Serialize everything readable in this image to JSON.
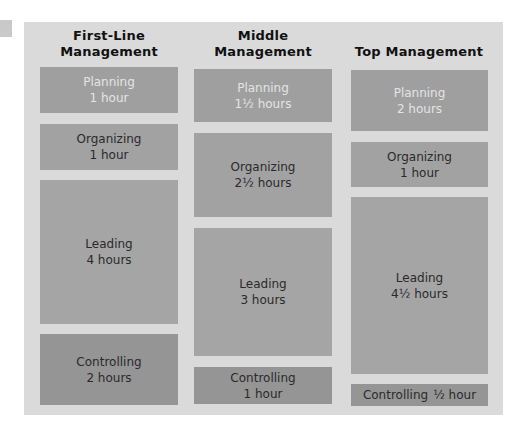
{
  "columns": [
    {
      "header_line1": "First-Line",
      "header_line2": "Management",
      "activities": [
        {
          "name": "Planning",
          "time": "1 hour",
          "hours": 1
        },
        {
          "name": "Organizing",
          "time": "1 hour",
          "hours": 1
        },
        {
          "name": "Leading",
          "time": "4 hours",
          "hours": 4
        },
        {
          "name": "Controlling",
          "time": "2 hours",
          "hours": 2
        }
      ]
    },
    {
      "header_line1": "Middle",
      "header_line2": "Management",
      "activities": [
        {
          "name": "Planning",
          "time": "1½ hours",
          "hours": 1.5
        },
        {
          "name": "Organizing",
          "time": "2½ hours",
          "hours": 2.5
        },
        {
          "name": "Leading",
          "time": "3 hours",
          "hours": 3
        },
        {
          "name": "Controlling",
          "time": "1 hour",
          "hours": 1
        }
      ]
    },
    {
      "header_line1": "Top Management",
      "header_line2": "",
      "activities": [
        {
          "name": "Planning",
          "time": "2 hours",
          "hours": 2
        },
        {
          "name": "Organizing",
          "time": "1 hour",
          "hours": 1
        },
        {
          "name": "Leading",
          "time": "4½ hours",
          "hours": 4.5
        },
        {
          "name": "Controlling",
          "time": "½ hour",
          "hours": 0.5
        }
      ]
    }
  ],
  "colors": {
    "panel_background": "#dadada",
    "planning_box": "#9f9f9f",
    "planning_text": "#e4e4e4",
    "organizing_box": "#a2a2a2",
    "leading_box": "#a5a5a5",
    "controlling_box": "#959595",
    "body_text": "#2a2a2a",
    "header_text": "#111111"
  }
}
